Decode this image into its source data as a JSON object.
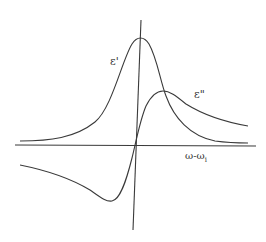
{
  "diagram": {
    "type": "dispersion-absorption curves",
    "labels": {
      "eps_real": "ε'",
      "eps_imag": "ε\"",
      "x_axis_main": "ω-ω",
      "x_axis_sub": "i"
    },
    "colors": {
      "line": "#3a3a3a",
      "background": "#ffffff"
    },
    "curves": [
      {
        "name": "ε'",
        "shape": "Lorentzian peak",
        "peak_at": "ω-ω_i = 0"
      },
      {
        "name": "ε\"",
        "shape": "dispersive (antisymmetric)",
        "zero_crossing_at": "ω-ω_i = 0"
      }
    ]
  }
}
